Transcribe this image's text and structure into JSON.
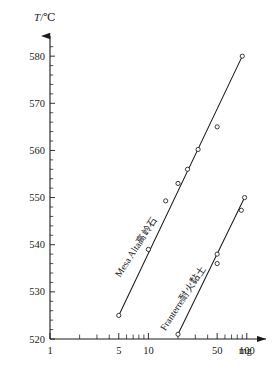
{
  "chart_data": {
    "type": "line",
    "title": "",
    "xlabel": "",
    "ylabel": "T/℃",
    "y_axis_title_symbol": "T",
    "y_axis_title_unit": "/℃",
    "x_unit": "mg",
    "xscale": "log",
    "xlim": [
      1,
      130
    ],
    "ylim": [
      520,
      583
    ],
    "grid": false,
    "legend": "inline-curve-labels",
    "x_tick_labels": [
      "1",
      "5",
      "10",
      "50",
      "100"
    ],
    "x_tick_values": [
      1,
      5,
      10,
      50,
      100
    ],
    "x_minor_ticks": [
      2,
      3,
      4,
      6,
      7,
      8,
      9,
      20,
      30,
      40,
      60,
      70,
      80,
      90
    ],
    "y_tick_labels": [
      "520",
      "530",
      "540",
      "550",
      "560",
      "570",
      "580"
    ],
    "y_tick_values": [
      520,
      530,
      540,
      550,
      560,
      570,
      580
    ],
    "series": [
      {
        "name": "Mesa Alta高岭石",
        "name_latin": "Mesa Alta",
        "name_cjk": "高岭石",
        "label_rotation_deg": -57,
        "points": [
          {
            "x": 5,
            "y": 525.0
          },
          {
            "x": 10,
            "y": 539.0
          },
          {
            "x": 15,
            "y": 549.3
          },
          {
            "x": 20,
            "y": 553.0
          },
          {
            "x": 25,
            "y": 556.0
          },
          {
            "x": 32,
            "y": 560.2
          },
          {
            "x": 50,
            "y": 565.0
          },
          {
            "x": 90,
            "y": 580.0
          }
        ],
        "fit_line": {
          "x1": 5,
          "y1": 525.0,
          "x2": 90,
          "y2": 580.0
        }
      },
      {
        "name": "Franterre耐火黏土",
        "name_latin": "Franterre",
        "name_cjk": "耐火黏土",
        "label_rotation_deg": -57,
        "points": [
          {
            "x": 20,
            "y": 521.0
          },
          {
            "x": 50,
            "y": 536.0
          },
          {
            "x": 50,
            "y": 538.0
          },
          {
            "x": 88,
            "y": 547.3
          },
          {
            "x": 95,
            "y": 550.0
          }
        ],
        "fit_line": {
          "x1": 20,
          "y1": 521.0,
          "x2": 95,
          "y2": 550.0
        }
      }
    ],
    "caption": ""
  },
  "axis": {
    "y_arrow": "arrow-up",
    "x_arrow": "arrow-right"
  }
}
